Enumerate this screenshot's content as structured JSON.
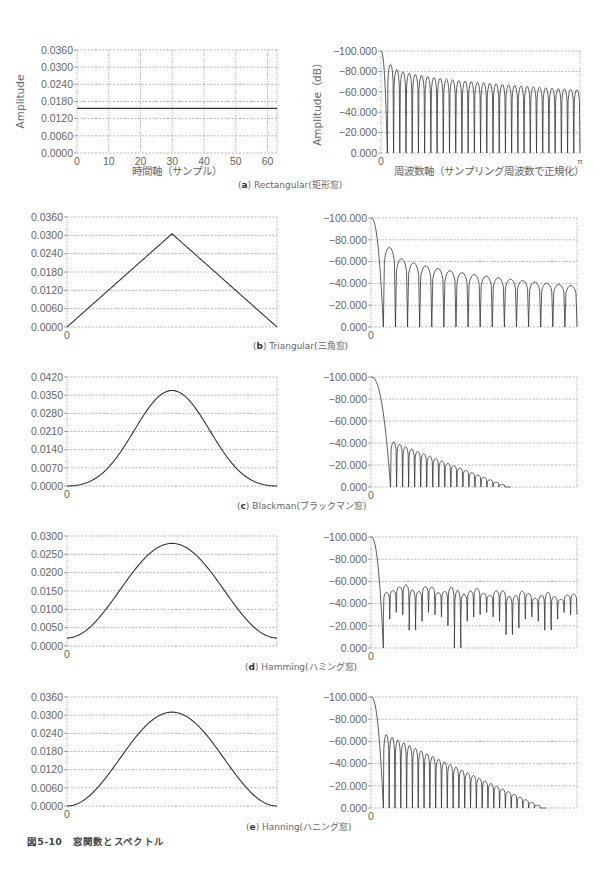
{
  "figure": {
    "caption": "図5-10　窓関数とスペクトル"
  },
  "panels": [
    {
      "id": "a",
      "letter": "a",
      "name": "Rectangular",
      "jp": "(矩形窓)",
      "caption_label": "Rectangular(矩形窓)",
      "caption_top": 178
    },
    {
      "id": "b",
      "letter": "b",
      "name": "Triangular",
      "jp": "(三角窓)",
      "caption_label": "Triangular(三角窓)",
      "caption_top": 339
    },
    {
      "id": "c",
      "letter": "c",
      "name": "Blackman",
      "jp": "(ブラックマン窓)",
      "caption_label": "Blackman(ブラックマン窓)",
      "caption_top": 499
    },
    {
      "id": "d",
      "letter": "d",
      "name": "Hamming",
      "jp": "(ハミング窓)",
      "caption_label": "Hamming(ハミング窓)",
      "caption_top": 660
    },
    {
      "id": "e",
      "letter": "e",
      "name": "Hanning",
      "jp": "(ハニング窓)",
      "caption_label": "Hanning(ハニング窓)",
      "caption_top": 820
    }
  ],
  "chart_data": [
    {
      "panel": "a",
      "side": "time",
      "type": "line",
      "title": "Rectangular window",
      "xlabel": "時間軸（サンプル）",
      "ylabel": "Amplitude",
      "xlim": [
        0,
        63
      ],
      "ylim": [
        0.0,
        0.036
      ],
      "xticks": [
        "0",
        "10",
        "20",
        "30",
        "40",
        "50",
        "60"
      ],
      "yticks": [
        "0.0000",
        "0.0060",
        "0.0120",
        "0.0180",
        "0.0240",
        "0.0300",
        "0.0360"
      ],
      "grid": true,
      "window": "rectangular",
      "peak": 0.0156,
      "N": 64,
      "frame": {
        "x0": 77,
        "x1": 277,
        "y0": 50,
        "y1": 153
      }
    },
    {
      "panel": "a",
      "side": "freq",
      "type": "line",
      "title": "Rectangular spectrum",
      "xlabel": "周波数軸（サンプリング周波数で正規化）",
      "ylabel": "Amplitude（dB）",
      "xlim": [
        "0",
        "π"
      ],
      "ylim": [
        -100,
        0
      ],
      "xticks": [
        "0",
        "π"
      ],
      "yticks": [
        "0.000",
        "-20.000",
        "-40.000",
        "-60.000",
        "-80.000",
        "-100.000"
      ],
      "grid": true,
      "window": "rectangular",
      "first_sidelobe_db": -13,
      "far_sidelobe_db": -38,
      "lobes": 31,
      "frame": {
        "x0": 381,
        "x1": 580,
        "y0": 51,
        "y1": 153
      }
    },
    {
      "panel": "b",
      "side": "time",
      "type": "line",
      "title": "Triangular window",
      "xlim": [
        0,
        63
      ],
      "ylim": [
        0.0,
        0.036
      ],
      "xticks": [
        "0"
      ],
      "yticks": [
        "0.0000",
        "0.0060",
        "0.0120",
        "0.0180",
        "0.0240",
        "0.0300",
        "0.0360"
      ],
      "grid": true,
      "window": "triangular",
      "peak": 0.0305,
      "end": 0.0,
      "frame": {
        "x0": 67,
        "x1": 277,
        "y0": 217,
        "y1": 327
      }
    },
    {
      "panel": "b",
      "side": "freq",
      "type": "line",
      "title": "Triangular spectrum",
      "xlim": [
        "0",
        "π"
      ],
      "ylim": [
        -100,
        0
      ],
      "xticks": [
        "0"
      ],
      "yticks": [
        "0.000",
        "-20.000",
        "-40.000",
        "-60.000",
        "-80.000",
        "-100.000"
      ],
      "grid": true,
      "window": "triangular",
      "first_sidelobe_db": -27,
      "far_sidelobe_db": -62,
      "lobes": 16,
      "frame": {
        "x0": 371,
        "x1": 577,
        "y0": 218,
        "y1": 327
      }
    },
    {
      "panel": "c",
      "side": "time",
      "type": "line",
      "title": "Blackman window",
      "xlim": [
        0,
        63
      ],
      "ylim": [
        0.0,
        0.042
      ],
      "xticks": [
        "0"
      ],
      "yticks": [
        "0.0000",
        "0.0070",
        "0.0140",
        "0.0210",
        "0.0280",
        "0.0350",
        "0.0420"
      ],
      "grid": true,
      "window": "blackman",
      "peak": 0.0368,
      "end": 0.0,
      "frame": {
        "x0": 67,
        "x1": 277,
        "y0": 377,
        "y1": 486
      }
    },
    {
      "panel": "c",
      "side": "freq",
      "type": "line",
      "title": "Blackman spectrum",
      "xlim": [
        "0",
        "π"
      ],
      "ylim": [
        -100,
        0
      ],
      "xticks": [
        "0"
      ],
      "yticks": [
        "0.000",
        "-20.000",
        "-40.000",
        "-60.000",
        "-80.000",
        "-100.000"
      ],
      "grid": true,
      "window": "blackman",
      "first_sidelobe_db": -59,
      "far_sidelobe_db": -100,
      "lobes": 20,
      "lobe_span_end": 0.68,
      "frame": {
        "x0": 371,
        "x1": 577,
        "y0": 377,
        "y1": 487
      }
    },
    {
      "panel": "d",
      "side": "time",
      "type": "line",
      "title": "Hamming window",
      "xlim": [
        0,
        63
      ],
      "ylim": [
        0.0,
        0.03
      ],
      "xticks": [
        "0"
      ],
      "yticks": [
        "0.0000",
        "0.0050",
        "0.0100",
        "0.0150",
        "0.0200",
        "0.0250",
        "0.0300"
      ],
      "grid": true,
      "window": "hamming",
      "peak": 0.028,
      "end": 0.0022,
      "frame": {
        "x0": 67,
        "x1": 277,
        "y0": 536,
        "y1": 646
      }
    },
    {
      "panel": "d",
      "side": "freq",
      "type": "line",
      "title": "Hamming spectrum",
      "xlim": [
        "0",
        "π"
      ],
      "ylim": [
        -100,
        0
      ],
      "xticks": [
        "0"
      ],
      "yticks": [
        "0.000",
        "-20.000",
        "-40.000",
        "-60.000",
        "-80.000",
        "-100.000"
      ],
      "grid": true,
      "window": "hamming",
      "first_sidelobe_db": -50,
      "sidelobe_range_db": [
        -45,
        -58
      ],
      "lobes": 30,
      "deep_nulls_db": [
        -74,
        -68,
        -66,
        -70,
        -84,
        -76,
        -68,
        -66,
        -70,
        -72,
        -80,
        -100,
        -76,
        -72,
        -70,
        -66,
        -68,
        -72,
        -76,
        -88,
        -82,
        -74,
        -70,
        -72,
        -76,
        -84
      ],
      "frame": {
        "x0": 371,
        "x1": 577,
        "y0": 537,
        "y1": 648
      }
    },
    {
      "panel": "e",
      "side": "time",
      "type": "line",
      "title": "Hanning window",
      "xlim": [
        0,
        63
      ],
      "ylim": [
        0.0,
        0.036
      ],
      "xticks": [
        "0"
      ],
      "yticks": [
        "0.0000",
        "0.0060",
        "0.0120",
        "0.0180",
        "0.0240",
        "0.0300",
        "0.0360"
      ],
      "grid": true,
      "window": "hanning",
      "peak": 0.031,
      "end": 0.0,
      "frame": {
        "x0": 67,
        "x1": 277,
        "y0": 697,
        "y1": 806
      }
    },
    {
      "panel": "e",
      "side": "freq",
      "type": "line",
      "title": "Hanning spectrum",
      "xlim": [
        "0",
        "π"
      ],
      "ylim": [
        -100,
        0
      ],
      "xticks": [
        "0"
      ],
      "yticks": [
        "0.000",
        "-20.000",
        "-40.000",
        "-60.000",
        "-80.000",
        "-100.000"
      ],
      "grid": true,
      "window": "hanning",
      "first_sidelobe_db": -34,
      "far_sidelobe_db": -100,
      "lobes": 28,
      "lobe_span_end": 0.85,
      "frame": {
        "x0": 371,
        "x1": 577,
        "y0": 697,
        "y1": 808
      }
    }
  ]
}
